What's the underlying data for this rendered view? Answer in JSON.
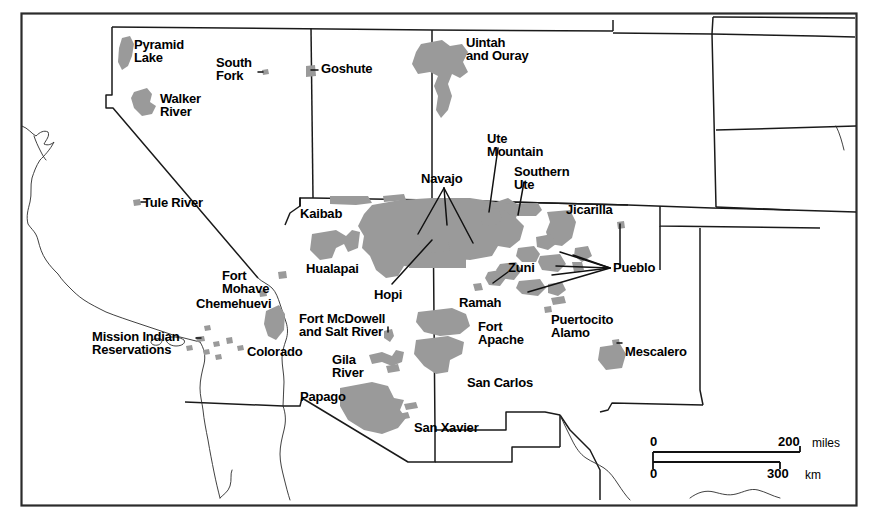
{
  "map": {
    "title": "Indian Reservations of the American Southwest",
    "background_color": "#ffffff",
    "reservation_fill": "#9a9a9a",
    "line_color": "#1a1a1a",
    "frame_color": "#2b2b2b",
    "label_color": "#000000"
  },
  "scale_bar": {
    "miles": {
      "zero": "0",
      "max": "200",
      "unit": "miles"
    },
    "km": {
      "zero": "0",
      "max": "300",
      "unit": "km"
    }
  },
  "labels": [
    {
      "id": "pyramid-lake",
      "text": "Pyramid\nLake",
      "x": 134,
      "y": 38,
      "align": "l",
      "size": "s13"
    },
    {
      "id": "south-fork",
      "text": "South\nFork",
      "x": 216,
      "y": 56,
      "align": "l",
      "size": "s13"
    },
    {
      "id": "goshute",
      "text": "Goshute",
      "x": 321,
      "y": 62,
      "align": "l",
      "size": "s13"
    },
    {
      "id": "uintah-and-ouray",
      "text": "Uintah\nand Ouray",
      "x": 466,
      "y": 36,
      "align": "l",
      "size": "s13"
    },
    {
      "id": "walker-river",
      "text": "Walker\nRiver",
      "x": 160,
      "y": 92,
      "align": "l",
      "size": "s13"
    },
    {
      "id": "ute-mountain",
      "text": "Ute\nMountain",
      "x": 487,
      "y": 132,
      "align": "l",
      "size": "s13"
    },
    {
      "id": "navajo",
      "text": "Navajo",
      "x": 421,
      "y": 172,
      "align": "l",
      "size": "s13"
    },
    {
      "id": "southern-ute",
      "text": "Southern\nUte",
      "x": 514,
      "y": 165,
      "align": "l",
      "size": "s13"
    },
    {
      "id": "tule-river",
      "text": "Tule River",
      "x": 143,
      "y": 196,
      "align": "l",
      "size": "s13"
    },
    {
      "id": "kaibab",
      "text": "Kaibab",
      "x": 300,
      "y": 207,
      "align": "l",
      "size": "s13"
    },
    {
      "id": "jicarilla",
      "text": "Jicarilla",
      "x": 566,
      "y": 203,
      "align": "l",
      "size": "s13"
    },
    {
      "id": "hualapai",
      "text": "Hualapai",
      "x": 306,
      "y": 262,
      "align": "l",
      "size": "s13"
    },
    {
      "id": "zuni",
      "text": "Zuni",
      "x": 508,
      "y": 261,
      "align": "l",
      "size": "s13"
    },
    {
      "id": "pueblo",
      "text": "Pueblo",
      "x": 613,
      "y": 261,
      "align": "l",
      "size": "s13"
    },
    {
      "id": "fort-mohave",
      "text": "Fort\nMohave",
      "x": 222,
      "y": 269,
      "align": "l",
      "size": "s13"
    },
    {
      "id": "hopi",
      "text": "Hopi",
      "x": 374,
      "y": 288,
      "align": "l",
      "size": "s13"
    },
    {
      "id": "ramah",
      "text": "Ramah",
      "x": 459,
      "y": 296,
      "align": "l",
      "size": "s13"
    },
    {
      "id": "chemehuevi",
      "text": "Chemehuevi",
      "x": 196,
      "y": 297,
      "align": "l",
      "size": "s13"
    },
    {
      "id": "fort-mcdowell",
      "text": "Fort McDowell\nand Salt River",
      "x": 299,
      "y": 312,
      "align": "l",
      "size": "s13"
    },
    {
      "id": "puertocito-alamo",
      "text": "Puertocito\nAlamo",
      "x": 551,
      "y": 313,
      "align": "l",
      "size": "s13"
    },
    {
      "id": "fort-apache",
      "text": "Fort\nApache",
      "x": 478,
      "y": 320,
      "align": "l",
      "size": "s13"
    },
    {
      "id": "mission-indian",
      "text": "Mission Indian\nReservations",
      "x": 92,
      "y": 330,
      "align": "l",
      "size": "s13"
    },
    {
      "id": "mescalero",
      "text": "Mescalero",
      "x": 625,
      "y": 345,
      "align": "l",
      "size": "s13"
    },
    {
      "id": "colorado",
      "text": "Colorado",
      "x": 247,
      "y": 345,
      "align": "l",
      "size": "s13"
    },
    {
      "id": "gila-river",
      "text": "Gila\nRiver",
      "x": 332,
      "y": 353,
      "align": "l",
      "size": "s13"
    },
    {
      "id": "san-carlos",
      "text": "San Carlos",
      "x": 467,
      "y": 376,
      "align": "l",
      "size": "s13"
    },
    {
      "id": "papago",
      "text": "Papago",
      "x": 300,
      "y": 390,
      "align": "l",
      "size": "s13"
    },
    {
      "id": "san-xavier",
      "text": "San Xavier",
      "x": 414,
      "y": 421,
      "align": "l",
      "size": "s13"
    }
  ]
}
